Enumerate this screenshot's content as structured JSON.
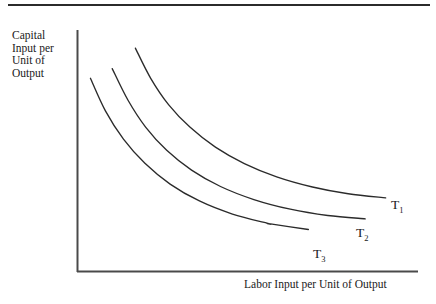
{
  "figure": {
    "title_rule": "top-horizontal-rule",
    "background_color": "#ffffff",
    "line_color": "#2b2b2b",
    "axis_color": "#4a4a4a"
  },
  "axes": {
    "y_label_lines": [
      "Capital",
      "Input per",
      "Unit of",
      "Output"
    ],
    "y_label_text": "Capital Input per Unit of Output",
    "x_label_text": "Labor Input per Unit of Output"
  },
  "curves": [
    {
      "name": "T1",
      "label_base": "T",
      "label_sub": "1"
    },
    {
      "name": "T2",
      "label_base": "T",
      "label_sub": "2"
    },
    {
      "name": "T3",
      "label_base": "T",
      "label_sub": "3"
    }
  ],
  "chart_data": {
    "type": "line",
    "title": "",
    "subtitle": "",
    "xlabel": "Labor Input per Unit of Output",
    "ylabel": "Capital Input per Unit of Output",
    "grid": false,
    "legend": "inline-end-of-curve",
    "axis_ticks": [],
    "xlim": [
      0,
      1
    ],
    "ylim": [
      0,
      1
    ],
    "annotations": [
      "T1",
      "T2",
      "T3"
    ],
    "note": "Three convex-to-origin isoquant curves; T1 is furthest from origin, T3 is closest.",
    "series": [
      {
        "name": "T1",
        "label": "T",
        "subscript": "1",
        "points": [
          [
            0.17,
            0.925
          ],
          [
            0.215,
            0.8
          ],
          [
            0.268,
            0.69
          ],
          [
            0.33,
            0.598
          ],
          [
            0.405,
            0.515
          ],
          [
            0.49,
            0.447
          ],
          [
            0.585,
            0.392
          ],
          [
            0.69,
            0.35
          ],
          [
            0.795,
            0.322
          ],
          [
            0.905,
            0.305
          ]
        ]
      },
      {
        "name": "T2",
        "label": "T",
        "subscript": "2",
        "points": [
          [
            0.102,
            0.84
          ],
          [
            0.148,
            0.71
          ],
          [
            0.2,
            0.598
          ],
          [
            0.262,
            0.502
          ],
          [
            0.335,
            0.42
          ],
          [
            0.42,
            0.352
          ],
          [
            0.518,
            0.298
          ],
          [
            0.625,
            0.258
          ],
          [
            0.735,
            0.232
          ],
          [
            0.845,
            0.218
          ]
        ]
      },
      {
        "name": "T3",
        "label": "T",
        "subscript": "3",
        "points": [
          [
            0.038,
            0.8
          ],
          [
            0.082,
            0.665
          ],
          [
            0.135,
            0.548
          ],
          [
            0.198,
            0.448
          ],
          [
            0.272,
            0.362
          ],
          [
            0.358,
            0.292
          ],
          [
            0.455,
            0.238
          ],
          [
            0.562,
            0.198
          ],
          [
            0.562,
            0.198
          ],
          [
            0.678,
            0.174
          ]
        ]
      }
    ]
  }
}
